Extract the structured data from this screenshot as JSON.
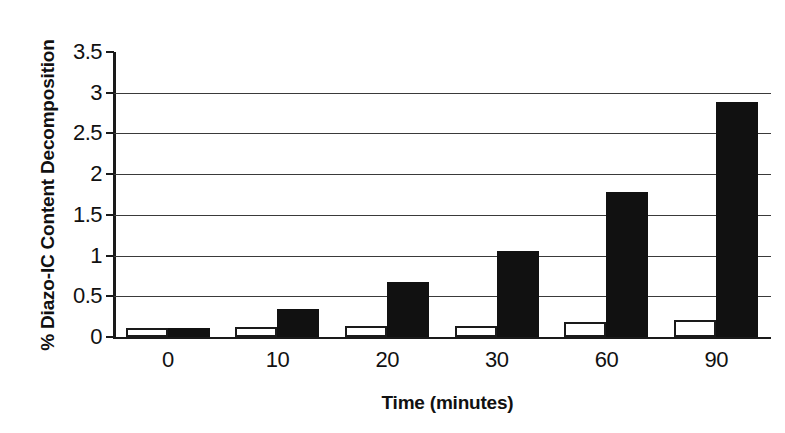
{
  "chart_data": {
    "type": "bar",
    "title": "",
    "xlabel": "Time (minutes)",
    "ylabel": "% Diazo-IC Content Decomposition",
    "categories": [
      "0",
      "10",
      "20",
      "30",
      "60",
      "90"
    ],
    "series": [
      {
        "name": "white-series",
        "style": "outlined",
        "color": "#ffffff",
        "values": [
          0.11,
          0.12,
          0.13,
          0.13,
          0.18,
          0.21
        ]
      },
      {
        "name": "black-series",
        "style": "filled",
        "color": "#111111",
        "values": [
          0.11,
          0.34,
          0.67,
          1.06,
          1.78,
          2.89
        ]
      }
    ],
    "ylim": [
      0,
      3.5
    ],
    "yticks": [
      "0",
      "0.5",
      "1",
      "1.5",
      "2",
      "2.5",
      "3",
      "3.5"
    ],
    "ytick_values": [
      0,
      0.5,
      1,
      1.5,
      2,
      2.5,
      3,
      3.5
    ],
    "grid": true,
    "legend": "none"
  },
  "axes": {
    "y_title": "% Diazo-IC Content Decomposition",
    "x_title": "Time (minutes)"
  }
}
